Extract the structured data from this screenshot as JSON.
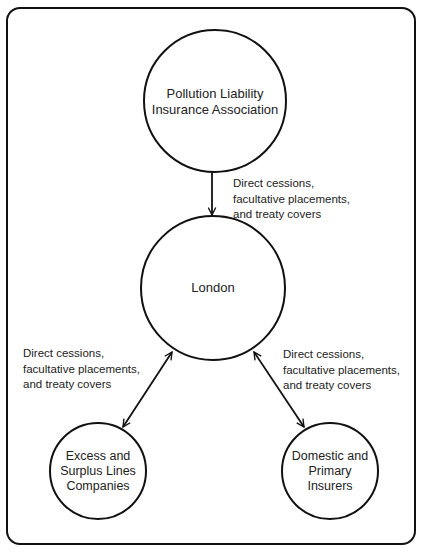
{
  "diagram": {
    "type": "flow",
    "nodes": [
      {
        "id": "plia",
        "label_lines": [
          "Pollution Liability",
          "Insurance Association"
        ]
      },
      {
        "id": "london",
        "label_lines": [
          "London"
        ]
      },
      {
        "id": "excess",
        "label_lines": [
          "Excess and",
          "Surplus Lines",
          "Companies"
        ]
      },
      {
        "id": "domestic",
        "label_lines": [
          "Domestic and",
          "Primary",
          "Insurers"
        ]
      }
    ],
    "edges": [
      {
        "from": "plia",
        "to": "london",
        "direction": "one-way",
        "label_lines": [
          "Direct cessions,",
          "facultative placements,",
          "and treaty covers"
        ]
      },
      {
        "from": "london",
        "to": "excess",
        "direction": "two-way",
        "label_lines": [
          "Direct cessions,",
          "facultative placements,",
          "and treaty covers"
        ]
      },
      {
        "from": "london",
        "to": "domestic",
        "direction": "two-way",
        "label_lines": [
          "Direct cessions,",
          "facultative placements,",
          "and treaty covers"
        ]
      }
    ]
  },
  "colors": {
    "stroke": "#111111",
    "text": "#222222",
    "background": "#ffffff"
  }
}
